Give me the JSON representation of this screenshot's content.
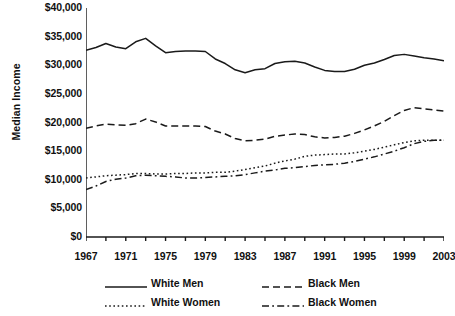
{
  "chart_data": {
    "type": "line",
    "title": "",
    "xlabel": "",
    "ylabel": "Median Income",
    "xlim": [
      1967,
      2003
    ],
    "ylim": [
      0,
      40000
    ],
    "grid": false,
    "legend_position": "bottom",
    "y_ticks": [
      0,
      5000,
      10000,
      15000,
      20000,
      25000,
      30000,
      35000,
      40000
    ],
    "y_tick_labels": [
      "$0",
      "$5,000",
      "$10,000",
      "$15,000",
      "$20,000",
      "$25,000",
      "$30,000",
      "$35,000",
      "$40,000"
    ],
    "x_ticks": [
      1967,
      1969,
      1971,
      1973,
      1975,
      1977,
      1979,
      1981,
      1983,
      1985,
      1987,
      1989,
      1991,
      1993,
      1995,
      1997,
      1999,
      2001,
      2003
    ],
    "x_tick_labels_shown": [
      "1967",
      "1971",
      "1975",
      "1979",
      "1983",
      "1987",
      "1991",
      "1995",
      "1999",
      "2003"
    ],
    "x": [
      1967,
      1968,
      1969,
      1970,
      1971,
      1972,
      1973,
      1974,
      1975,
      1976,
      1977,
      1978,
      1979,
      1980,
      1981,
      1982,
      1983,
      1984,
      1985,
      1986,
      1987,
      1988,
      1989,
      1990,
      1991,
      1992,
      1993,
      1994,
      1995,
      1996,
      1997,
      1998,
      1999,
      2000,
      2001,
      2002,
      2003
    ],
    "series": [
      {
        "name": "White Men",
        "style": "solid",
        "color": "#1a1a1a",
        "values": [
          32600,
          33100,
          33800,
          33200,
          32900,
          34100,
          34700,
          33400,
          32200,
          32400,
          32500,
          32500,
          32400,
          31100,
          30300,
          29200,
          28700,
          29200,
          29400,
          30300,
          30600,
          30700,
          30400,
          29700,
          29100,
          28900,
          28900,
          29300,
          30000,
          30400,
          31000,
          31700,
          31900,
          31600,
          31300,
          31100,
          30800
        ]
      },
      {
        "name": "White Women",
        "style": "dotted",
        "color": "#1a1a1a",
        "values": [
          10300,
          10500,
          10700,
          10800,
          10900,
          11100,
          11100,
          11000,
          11000,
          11100,
          11100,
          11200,
          11200,
          11300,
          11300,
          11500,
          11800,
          12100,
          12400,
          12900,
          13300,
          13600,
          14100,
          14300,
          14400,
          14500,
          14500,
          14700,
          15000,
          15300,
          15700,
          16100,
          16500,
          16800,
          16900,
          16900,
          16900
        ]
      },
      {
        "name": "Black Men",
        "style": "dashed",
        "color": "#1a1a1a",
        "values": [
          19000,
          19400,
          19700,
          19600,
          19500,
          19800,
          20600,
          20100,
          19400,
          19400,
          19400,
          19400,
          19300,
          18500,
          18000,
          17200,
          16800,
          16900,
          17100,
          17600,
          17800,
          18000,
          17900,
          17500,
          17300,
          17400,
          17600,
          18100,
          18700,
          19400,
          20200,
          21200,
          22100,
          22600,
          22400,
          22200,
          22000
        ]
      },
      {
        "name": "Black Women",
        "style": "dashdot",
        "color": "#1a1a1a",
        "values": [
          8300,
          8900,
          9700,
          10100,
          10300,
          10700,
          10800,
          10700,
          10600,
          10500,
          10300,
          10300,
          10400,
          10500,
          10600,
          10700,
          10900,
          11200,
          11500,
          11700,
          12000,
          12100,
          12300,
          12500,
          12600,
          12700,
          12900,
          13200,
          13600,
          14000,
          14500,
          15000,
          15600,
          16300,
          16700,
          16900,
          16900
        ]
      }
    ]
  },
  "legend": {
    "items": [
      {
        "label": "White Men",
        "style": "solid"
      },
      {
        "label": "White Women",
        "style": "dotted"
      },
      {
        "label": "Black Men",
        "style": "dashed"
      },
      {
        "label": "Black Women",
        "style": "dashdot"
      }
    ]
  }
}
